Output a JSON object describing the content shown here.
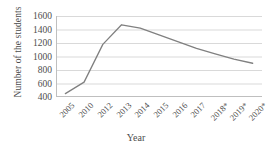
{
  "chart_data": {
    "type": "line",
    "title": "",
    "xlabel": "Year",
    "ylabel": "Number of the students",
    "categories": [
      "2005",
      "2010",
      "2012",
      "2013",
      "2014",
      "2015",
      "2016",
      "2017",
      "2018*",
      "2019*",
      "2020*"
    ],
    "values": [
      450,
      620,
      1180,
      1470,
      1420,
      1320,
      1220,
      1120,
      1040,
      960,
      900
    ],
    "series": [
      {
        "name": "Number of the students",
        "values": [
          450,
          620,
          1180,
          1470,
          1420,
          1320,
          1220,
          1120,
          1040,
          960,
          900
        ]
      }
    ],
    "ylim": [
      400,
      1600
    ],
    "yticks": [
      400,
      600,
      800,
      1000,
      1200,
      1400,
      1600
    ],
    "ytick_labels": [
      "1600",
      "1400",
      "1200",
      "1000",
      "800",
      "600",
      "400"
    ],
    "grid": "horizontal",
    "legend": "none",
    "line_color": "#808080",
    "grid_color": "#d9d9d9",
    "axis_color": "#bfbfbf",
    "text_color": "#4d4d4d",
    "background": "#ffffff"
  },
  "axes": {
    "y_title": "Number of the students",
    "x_title": "Year"
  }
}
